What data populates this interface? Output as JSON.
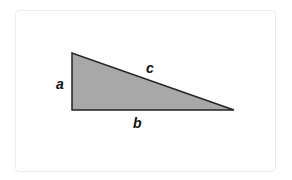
{
  "diagram": {
    "type": "right-triangle",
    "labels": {
      "vertical_side": "a",
      "horizontal_side": "b",
      "hypotenuse": "c"
    },
    "colors": {
      "fill": "#a8a8a8",
      "stroke": "#222222"
    }
  }
}
